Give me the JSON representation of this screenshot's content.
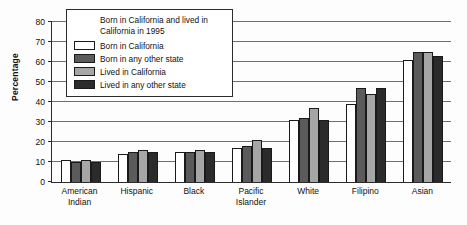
{
  "chart_data": {
    "type": "bar",
    "title": "",
    "xlabel": "",
    "ylabel": "Percentage",
    "ylim": [
      0,
      80
    ],
    "yticks": [
      0,
      10,
      20,
      30,
      40,
      50,
      60,
      70,
      80
    ],
    "grid": true,
    "legend_position": "top-left-inside",
    "legend_title": "Born in California and lived in California in 1995",
    "categories": [
      "American Indian",
      "Hispanic",
      "Black",
      "Pacific Islander",
      "White",
      "Filipino",
      "Asian"
    ],
    "category_lines": [
      [
        "American",
        "Indian"
      ],
      [
        "Hispanic",
        ""
      ],
      [
        "Black",
        ""
      ],
      [
        "Pacific",
        "Islander"
      ],
      [
        "White",
        ""
      ],
      [
        "Filipino",
        ""
      ],
      [
        "Asian",
        ""
      ]
    ],
    "series": [
      {
        "name": "Born in California",
        "color": "#ffffff",
        "values": [
          11,
          14,
          15,
          17,
          31,
          39,
          61
        ]
      },
      {
        "name": "Born in any other state",
        "color": "#5b5b5b",
        "values": [
          10,
          15,
          15,
          18,
          32,
          47,
          65
        ]
      },
      {
        "name": "Lived in California",
        "color": "#a6a6a6",
        "values": [
          11,
          16,
          16,
          21,
          37,
          44,
          65
        ]
      },
      {
        "name": "Lived in any other state",
        "color": "#2b2b2b",
        "values": [
          10,
          15,
          15,
          17,
          31,
          47,
          63
        ]
      }
    ]
  }
}
